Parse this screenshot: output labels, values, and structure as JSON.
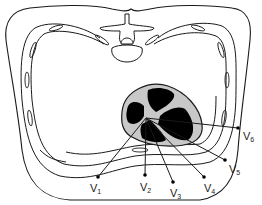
{
  "diagram": {
    "colors": {
      "outline": "#1a1a1a",
      "heart_wall": "#c8c8c8",
      "chambers": "#000000",
      "background": "#ffffff"
    },
    "origin": {
      "x": 146,
      "y": 118
    },
    "leads": [
      {
        "id": "V1",
        "prefix": "V",
        "sub": "1",
        "dot": {
          "x": 98,
          "y": 177
        },
        "label": {
          "x": 90,
          "y": 192
        }
      },
      {
        "id": "V2",
        "prefix": "V",
        "sub": "2",
        "dot": {
          "x": 145,
          "y": 175
        },
        "label": {
          "x": 140,
          "y": 191
        }
      },
      {
        "id": "V3",
        "prefix": "V",
        "sub": "3",
        "dot": {
          "x": 173,
          "y": 182
        },
        "label": {
          "x": 170,
          "y": 197
        }
      },
      {
        "id": "V4",
        "prefix": "V",
        "sub": "4",
        "dot": {
          "x": 204,
          "y": 177
        },
        "label": {
          "x": 204,
          "y": 192
        }
      },
      {
        "id": "V5",
        "prefix": "V",
        "sub": "5",
        "dot": {
          "x": 225,
          "y": 160
        },
        "label": {
          "x": 229,
          "y": 173
        }
      },
      {
        "id": "V6",
        "prefix": "V",
        "sub": "6",
        "dot": {
          "x": 238,
          "y": 128
        },
        "label": {
          "x": 243,
          "y": 140
        }
      }
    ]
  }
}
